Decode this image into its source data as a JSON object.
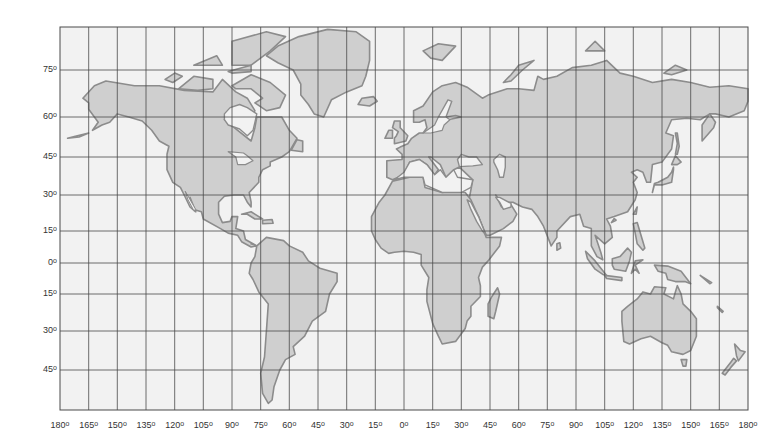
{
  "map": {
    "type": "world-map-mercator-grid",
    "colors": {
      "background": "#f2f2f2",
      "land_fill": "#cfcfcf",
      "land_stroke": "#8c8c8c",
      "grid": "#4a4a4a",
      "label": "#333333"
    },
    "frame": {
      "left": 60,
      "right": 748,
      "top": 27,
      "bottom": 410
    },
    "latitude_labels": [
      {
        "text": "75",
        "lat": 75,
        "y": 70
      },
      {
        "text": "60",
        "lat": 60,
        "y": 117
      },
      {
        "text": "45",
        "lat": 45,
        "y": 157
      },
      {
        "text": "30",
        "lat": 30,
        "y": 195
      },
      {
        "text": "15",
        "lat": 15,
        "y": 231
      },
      {
        "text": "0",
        "lat": 0,
        "y": 263
      },
      {
        "text": "15",
        "lat": -15,
        "y": 294
      },
      {
        "text": "30",
        "lat": -30,
        "y": 331
      },
      {
        "text": "45",
        "lat": -45,
        "y": 370
      }
    ],
    "longitude_labels": [
      "180",
      "165",
      "150",
      "135",
      "120",
      "105",
      "90",
      "75",
      "60",
      "45",
      "30",
      "15",
      "0",
      "15",
      "30",
      "45",
      "60",
      "75",
      "90",
      "105",
      "120",
      "135",
      "150",
      "165",
      "180"
    ],
    "degree_symbol": "o",
    "continents": [
      "North America",
      "Greenland",
      "South America",
      "Europe",
      "Africa",
      "Asia",
      "Australia",
      "New Zealand",
      "Antarctic islands"
    ]
  }
}
